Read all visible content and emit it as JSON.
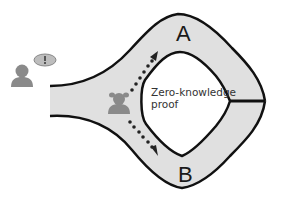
{
  "diagram": {
    "paths": [
      {
        "id": "A",
        "label": "A"
      },
      {
        "id": "B",
        "label": "B"
      }
    ],
    "center_text": "Zero-knowledge proof",
    "center_text_lines": [
      "Zero-knowledge",
      "proof"
    ],
    "actors": [
      {
        "name": "verifier",
        "icon": "person-icon",
        "note": "with speech bubble showing exclamation"
      },
      {
        "name": "prover",
        "icon": "person-icon",
        "note": "inside cave at fork"
      }
    ],
    "door": "magic door connecting paths A and B",
    "colors": {
      "cave_fill": "#e0e0e0",
      "outline": "#111111",
      "person": "#8a8a8a"
    }
  }
}
